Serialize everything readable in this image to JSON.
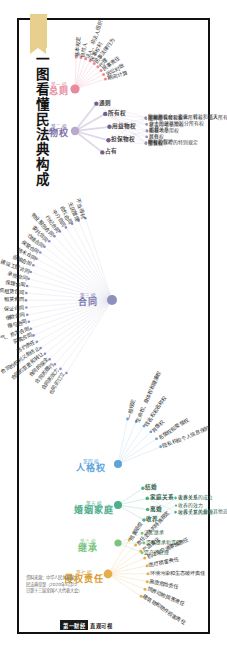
{
  "poster": {
    "title": "一图看懂民法典构成",
    "ribbon_icon": "bookmark-ribbon",
    "source_note": "资料来源：中华人民共和国\n民法典草案（2020年5月22\n日第十三届全国人大代表大会）",
    "credit_tag": "第一财经",
    "credit_name": "直观可视"
  },
  "colors": {
    "part1": "#e8899c",
    "part2": "#b9aacd",
    "part3": "#8e8ebf",
    "part4": "#5ea4d8",
    "part5": "#4fae8b",
    "part6": "#7cc47e",
    "part7": "#e5ae4a",
    "frame": "#111111",
    "ribbon": "#e9cf8e"
  },
  "chart_data": {
    "type": "radial-mindmap",
    "title": "一图看懂民法典构成",
    "parts": [
      {
        "index": "第一编",
        "name": "总则",
        "color": "#e8899c",
        "cx": 75,
        "cy": 89,
        "r": 32,
        "branches": [
          "基本规定",
          "自然人",
          "法人、非法人组织",
          "民事权利",
          "民事法律行为",
          "代理",
          "民事责任",
          "诉讼时效",
          "期间计算"
        ]
      },
      {
        "index": "第二编",
        "name": "物权",
        "color": "#b9aacd",
        "cx": 75,
        "cy": 131,
        "r": 56,
        "mid_nodes": [
          {
            "label": "通则",
            "leaves": [
              "物权的设立、变更、转让和消灭",
              "物权的保护"
            ]
          },
          {
            "label": "所有权",
            "leaves": [
              "国家所有权和集体所有权、私人所有权",
              "业主的建筑物区分所有权",
              "相邻关系",
              "共有",
              "所有权取得的特别规定"
            ]
          },
          {
            "label": "用益物权",
            "leaves": [
              "土地承包经营权",
              "建设用地使用权",
              "宅基地使用权",
              "居住权",
              "地役权"
            ]
          },
          {
            "label": "担保物权",
            "leaves": [
              "抵押权",
              "质权",
              "留置权"
            ]
          },
          {
            "label": "占有",
            "leaves": []
          }
        ]
      },
      {
        "index": "第三编",
        "name": "合同",
        "color": "#8e8ebf",
        "cx": 112,
        "cy": 300,
        "r": 86,
        "mid_nodes": [
          {
            "label": "通则",
            "leaves": []
          },
          {
            "label": "典型合同",
            "leaves": []
          },
          {
            "label": "准合同",
            "leaves": []
          }
        ],
        "branches": [
          "合同的订立",
          "合同的效力",
          "合同的履行",
          "合同的保全",
          "合同的变更和转让",
          "合同的权利义务终止",
          "违约责任",
          "买卖合同",
          "供用电、水、气、热力合同",
          "赠与合同",
          "借款合同",
          "保证合同",
          "租赁合同",
          "融资租赁合同",
          "保理合同",
          "承揽合同",
          "建设工程合同",
          "运输合同",
          "技术合同",
          "保管合同",
          "仓储合同",
          "委托合同",
          "物业服务合同",
          "行纪合同",
          "中介合同",
          "合伙合同",
          "无因管理",
          "不当得利"
        ]
      },
      {
        "index": "第四编",
        "name": "人格权",
        "color": "#5ea4d8",
        "cx": 118,
        "cy": 464,
        "r": 46,
        "branches": [
          "一般规定",
          "生命权、身体权和健康权",
          "姓名权和名称权",
          "肖像权",
          "名誉权和荣誉权",
          "隐私权和个人信息保护"
        ]
      },
      {
        "index": "第五编",
        "name": "婚姻家庭",
        "color": "#4fae8b",
        "cx": 118,
        "cy": 505,
        "r": 30,
        "mid_nodes": [
          {
            "label": "结婚",
            "leaves": []
          },
          {
            "label": "家庭关系",
            "leaves": [
              "夫妻关系",
              "父母子女关系和其他近亲属关系"
            ]
          },
          {
            "label": "离婚",
            "leaves": []
          },
          {
            "label": "收养",
            "leaves": [
              "收养关系的成立",
              "收养的效力",
              "收养关系的解除"
            ]
          }
        ]
      },
      {
        "index": "第六编",
        "name": "继承",
        "color": "#7cc47e",
        "cx": 118,
        "cy": 543,
        "r": 26,
        "branches": [
          "法定继承",
          "遗嘱继承和遗赠",
          "遗产的处理"
        ]
      },
      {
        "index": "第七编",
        "name": "侵权责任",
        "color": "#e5ae4a",
        "cx": 108,
        "cy": 574,
        "r": 40,
        "branches": [
          "损害赔偿",
          "责任主体的特殊规定",
          "产品责任",
          "机动车交通事故责任",
          "医疗损害责任",
          "环境污染和生态破坏责任",
          "高度危险责任",
          "饲养动物损害责任",
          "建筑物和物件损害责任"
        ]
      }
    ]
  }
}
